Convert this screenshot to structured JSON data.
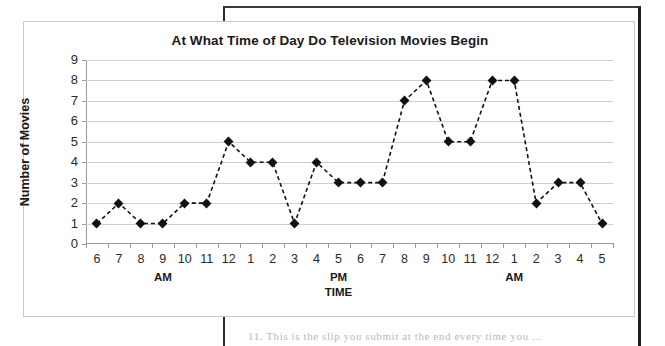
{
  "document": {
    "page_text_fragment": "11. This is the slip you submit at the end every time you ..."
  },
  "chart_data": {
    "type": "line",
    "title": "At What Time of Day Do Television Movies Begin",
    "xlabel": "TIME",
    "ylabel": "Number of Movies",
    "ylim": [
      0,
      9
    ],
    "yticks": [
      "0",
      "1",
      "2",
      "3",
      "4",
      "5",
      "6",
      "7",
      "8",
      "9"
    ],
    "grid": true,
    "legend": "none",
    "marker": "diamond",
    "line_style": "dashed",
    "series_color": "#111111",
    "grid_color": "#cfcfcf",
    "axis_color": "#9a9a9a",
    "categories": [
      "6",
      "7",
      "8",
      "9",
      "10",
      "11",
      "12",
      "1",
      "2",
      "3",
      "4",
      "5",
      "6",
      "7",
      "8",
      "9",
      "10",
      "11",
      "12",
      "1",
      "2",
      "3",
      "4",
      "5"
    ],
    "values": [
      1,
      2,
      1,
      1,
      2,
      2,
      5,
      4,
      4,
      1,
      4,
      3,
      3,
      3,
      7,
      8,
      5,
      5,
      8,
      8,
      2,
      3,
      3,
      1
    ],
    "meridiem_labels": [
      {
        "text": "AM",
        "at_category_index": 3
      },
      {
        "text": "PM",
        "at_category_index": 11
      },
      {
        "text": "AM",
        "at_category_index": 19
      }
    ],
    "xlabel_at_category_index": 11
  }
}
